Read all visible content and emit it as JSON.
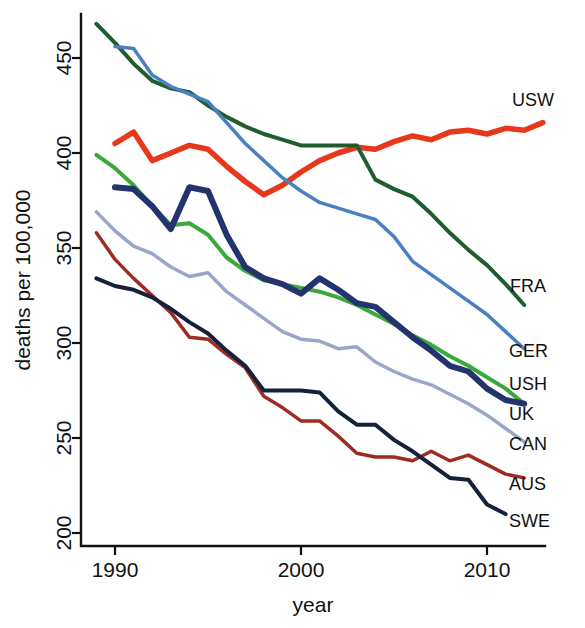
{
  "chart_data": {
    "type": "line",
    "title": "",
    "xlabel": "year",
    "ylabel": "deaths per 100,000",
    "xlim": [
      1988.6,
      2013.2
    ],
    "ylim": [
      195,
      475
    ],
    "xticks": [
      1990,
      2000,
      2010
    ],
    "yticks": [
      200,
      250,
      300,
      350,
      400,
      450
    ],
    "grid": false,
    "legend_position": "right-inline-labels",
    "series": [
      {
        "name": "USW",
        "label": "USW",
        "color": "#e8381b",
        "linewidth": 5.5,
        "x": [
          1990,
          1991,
          1992,
          1993,
          1994,
          1995,
          1996,
          1997,
          1998,
          1999,
          2000,
          2001,
          2002,
          2003,
          2004,
          2005,
          2006,
          2007,
          2008,
          2009,
          2010,
          2011,
          2012,
          2013
        ],
        "y": [
          405,
          411,
          396,
          400,
          404,
          402,
          393,
          385,
          378,
          383,
          390,
          396,
          400,
          403,
          402,
          406,
          409,
          407,
          411,
          412,
          410,
          413,
          412,
          416
        ]
      },
      {
        "name": "FRA",
        "label": "FRA",
        "color": "#1f5c2e",
        "linewidth": 4,
        "x": [
          1989,
          1990,
          1991,
          1992,
          1993,
          1994,
          1995,
          1996,
          1997,
          1998,
          1999,
          2000,
          2001,
          2002,
          2003,
          2004,
          2005,
          2006,
          2007,
          2008,
          2009,
          2010,
          2011,
          2012
        ],
        "y": [
          468,
          458,
          447,
          438,
          434,
          432,
          425,
          419,
          414,
          410,
          407,
          404,
          404,
          404,
          404,
          386,
          381,
          377,
          368,
          358,
          349,
          341,
          331,
          320
        ]
      },
      {
        "name": "GER",
        "label": "GER",
        "color": "#4a7fc1",
        "linewidth": 3.5,
        "x": [
          1990,
          1991,
          1992,
          1993,
          1994,
          1995,
          1996,
          1997,
          1998,
          1999,
          2000,
          2001,
          2002,
          2003,
          2004,
          2005,
          2006,
          2007,
          2008,
          2009,
          2010,
          2011,
          2012
        ],
        "y": [
          456,
          455,
          441,
          435,
          431,
          427,
          416,
          405,
          396,
          387,
          380,
          374,
          371,
          368,
          365,
          356,
          343,
          336,
          329,
          322,
          315,
          306,
          297
        ]
      },
      {
        "name": "USH",
        "label": "USH",
        "color": "#3aa93a",
        "linewidth": 4,
        "x": [
          1989,
          1990,
          1991,
          1992,
          1993,
          1994,
          1995,
          1996,
          1997,
          1998,
          1999,
          2000,
          2001,
          2002,
          2003,
          2004,
          2005,
          2006,
          2007,
          2008,
          2009,
          2010,
          2011,
          2012
        ],
        "y": [
          399,
          392,
          383,
          372,
          362,
          363,
          357,
          345,
          338,
          333,
          331,
          329,
          327,
          324,
          320,
          315,
          310,
          304,
          299,
          293,
          288,
          282,
          276,
          268
        ]
      },
      {
        "name": "UK",
        "label": "UK",
        "color": "#23336e",
        "linewidth": 6,
        "x": [
          1990,
          1991,
          1992,
          1993,
          1994,
          1995,
          1996,
          1997,
          1998,
          1999,
          2000,
          2001,
          2002,
          2003,
          2004,
          2005,
          2006,
          2007,
          2008,
          2009,
          2010,
          2011,
          2012
        ],
        "y": [
          382,
          381,
          372,
          360,
          382,
          380,
          357,
          340,
          334,
          331,
          326,
          334,
          328,
          321,
          319,
          311,
          303,
          296,
          288,
          285,
          276,
          270,
          268
        ]
      },
      {
        "name": "CAN",
        "label": "CAN",
        "color": "#9aa5c9",
        "linewidth": 3.5,
        "x": [
          1989,
          1990,
          1991,
          1992,
          1993,
          1994,
          1995,
          1996,
          1997,
          1998,
          1999,
          2000,
          2001,
          2002,
          2003,
          2004,
          2005,
          2006,
          2007,
          2008,
          2009,
          2010,
          2011,
          2012
        ],
        "y": [
          369,
          359,
          351,
          347,
          340,
          335,
          337,
          327,
          320,
          313,
          306,
          302,
          301,
          297,
          298,
          290,
          285,
          281,
          278,
          273,
          268,
          262,
          255,
          248
        ]
      },
      {
        "name": "AUS",
        "label": "AUS",
        "color": "#9e2b24",
        "linewidth": 3.5,
        "x": [
          1989,
          1990,
          1991,
          1992,
          1993,
          1994,
          1995,
          1996,
          1997,
          1998,
          1999,
          2000,
          2001,
          2002,
          2003,
          2004,
          2005,
          2006,
          2007,
          2008,
          2009,
          2010,
          2011,
          2012
        ],
        "y": [
          358,
          344,
          334,
          325,
          316,
          303,
          302,
          294,
          287,
          272,
          266,
          259,
          259,
          251,
          242,
          240,
          240,
          238,
          243,
          238,
          241,
          236,
          231,
          229
        ]
      },
      {
        "name": "SWE",
        "label": "SWE",
        "color": "#15203a",
        "linewidth": 4,
        "x": [
          1989,
          1990,
          1991,
          1992,
          1993,
          1994,
          1995,
          1996,
          1997,
          1998,
          1999,
          2000,
          2001,
          2002,
          2003,
          2004,
          2005,
          2006,
          2007,
          2008,
          2009,
          2010,
          2011
        ],
        "y": [
          334,
          330,
          328,
          324,
          318,
          311,
          305,
          296,
          288,
          275,
          275,
          275,
          274,
          264,
          257,
          257,
          249,
          243,
          236,
          229,
          228,
          215,
          210
        ]
      }
    ],
    "labels": [
      {
        "text": "USW",
        "x": 512,
        "y": 106
      },
      {
        "text": "FRA",
        "x": 510,
        "y": 292
      },
      {
        "text": "GER",
        "x": 509,
        "y": 357
      },
      {
        "text": "USH",
        "x": 509,
        "y": 390
      },
      {
        "text": "UK",
        "x": 509,
        "y": 420
      },
      {
        "text": "CAN",
        "x": 509,
        "y": 450
      },
      {
        "text": "AUS",
        "x": 509,
        "y": 490
      },
      {
        "text": "SWE",
        "x": 509,
        "y": 527
      }
    ]
  }
}
